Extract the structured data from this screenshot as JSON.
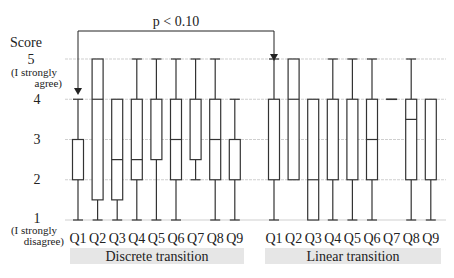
{
  "chart_data": {
    "type": "boxplot",
    "title": "",
    "ylabel": "Score",
    "ylim": [
      1,
      5
    ],
    "yticks": [
      {
        "value": 5,
        "label": "5",
        "sublabel": "(I strongly agree)"
      },
      {
        "value": 4,
        "label": "4"
      },
      {
        "value": 3,
        "label": "3"
      },
      {
        "value": 2,
        "label": "2"
      },
      {
        "value": 1,
        "label": "1",
        "sublabel": "(I strongly disagree)"
      }
    ],
    "grid": true,
    "annotation": {
      "text": "p < 0.10",
      "from": "Discrete transition Q1",
      "to": "Linear transition Q1"
    },
    "groups": [
      {
        "name": "Discrete transition",
        "categories": [
          "Q1",
          "Q2",
          "Q3",
          "Q4",
          "Q5",
          "Q6",
          "Q7",
          "Q8",
          "Q9"
        ],
        "boxes": [
          {
            "min": 1,
            "q1": 2,
            "median": 3,
            "q3": 3,
            "max": 4
          },
          {
            "min": 1,
            "q1": 1.5,
            "median": 4,
            "q3": 5,
            "max": 5
          },
          {
            "min": 1,
            "q1": 1.5,
            "median": 2.5,
            "q3": 4,
            "max": 4
          },
          {
            "min": 1,
            "q1": 2,
            "median": 2.5,
            "q3": 4,
            "max": 5
          },
          {
            "min": 1,
            "q1": 2.5,
            "median": 4,
            "q3": 4,
            "max": 5
          },
          {
            "min": 1,
            "q1": 2,
            "median": 3,
            "q3": 4,
            "max": 5
          },
          {
            "min": 2,
            "q1": 2.5,
            "median": 4,
            "q3": 4,
            "max": 5
          },
          {
            "min": 1,
            "q1": 2,
            "median": 3,
            "q3": 4,
            "max": 5
          },
          {
            "min": 1,
            "q1": 2,
            "median": 3,
            "q3": 3,
            "max": 4
          }
        ]
      },
      {
        "name": "Linear transition",
        "categories": [
          "Q1",
          "Q2",
          "Q3",
          "Q4",
          "Q5",
          "Q6",
          "Q7",
          "Q8",
          "Q9"
        ],
        "boxes": [
          {
            "min": 1,
            "q1": 2,
            "median": 4,
            "q3": 4,
            "max": 5
          },
          {
            "min": 2,
            "q1": 2,
            "median": 4,
            "q3": 5,
            "max": 5
          },
          {
            "min": 1,
            "q1": 1,
            "median": 2,
            "q3": 4,
            "max": 4
          },
          {
            "min": 1,
            "q1": 2,
            "median": 4,
            "q3": 4,
            "max": 5
          },
          {
            "min": 1,
            "q1": 2,
            "median": 4,
            "q3": 4,
            "max": 5
          },
          {
            "min": 1,
            "q1": 2,
            "median": 3,
            "q3": 4,
            "max": 5
          },
          {
            "min": 4,
            "q1": 4,
            "median": 4,
            "q3": 4,
            "max": 4
          },
          {
            "min": 1,
            "q1": 2,
            "median": 3.5,
            "q3": 4,
            "max": 5
          },
          {
            "min": 1,
            "q1": 2,
            "median": 4,
            "q3": 4,
            "max": 4
          }
        ]
      }
    ]
  },
  "labels": {
    "score": "Score",
    "y5": "5",
    "y5_sub1": "(I strongly",
    "y5_sub2": "agree)",
    "y4": "4",
    "y3": "3",
    "y2": "2",
    "y1": "1",
    "y1_sub1": "(I strongly",
    "y1_sub2": "disagree)",
    "pvalue": "p < 0.10",
    "group1": "Discrete transition",
    "group2": "Linear transition"
  }
}
